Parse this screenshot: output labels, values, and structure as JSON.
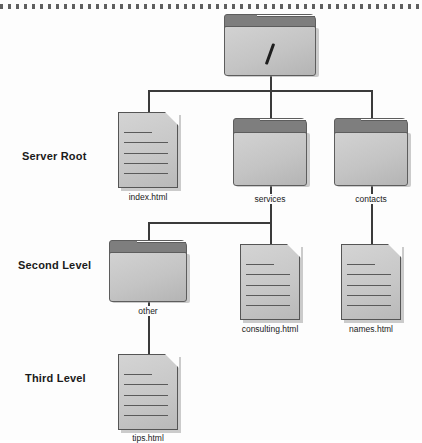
{
  "page": {
    "background_color": "#fdfdfd",
    "line_color": "#3b3b3b",
    "folder_front_color": "#c4c4c4",
    "folder_tab_color": "#7e7e7e",
    "doc_color": "#c6c6c6"
  },
  "row_labels": [
    {
      "text": "Server Root",
      "name": "row-label-server-root"
    },
    {
      "text": "Second Level",
      "name": "row-label-second-level"
    },
    {
      "text": "Third Level",
      "name": "row-label-third-level"
    }
  ],
  "nodes": {
    "root": {
      "label": "/",
      "type": "folder",
      "level": "root"
    },
    "index_html": {
      "label": "index.html",
      "type": "document",
      "level": "Server Root"
    },
    "services": {
      "label": "services",
      "type": "folder",
      "level": "Server Root"
    },
    "contacts": {
      "label": "contacts",
      "type": "folder",
      "level": "Server Root"
    },
    "other": {
      "label": "other",
      "type": "folder",
      "level": "Second Level"
    },
    "consulting_html": {
      "label": "consulting.html",
      "type": "document",
      "level": "Second Level"
    },
    "names_html": {
      "label": "names.html",
      "type": "document",
      "level": "Second Level"
    },
    "tips_html": {
      "label": "tips.html",
      "type": "document",
      "level": "Third Level"
    }
  },
  "tree": {
    "root": "/",
    "children": [
      {
        "label": "index.html",
        "type": "document"
      },
      {
        "label": "services",
        "type": "folder",
        "children": [
          {
            "label": "other",
            "type": "folder",
            "children": [
              {
                "label": "tips.html",
                "type": "document"
              }
            ]
          },
          {
            "label": "consulting.html",
            "type": "document"
          }
        ]
      },
      {
        "label": "contacts",
        "type": "folder",
        "children": [
          {
            "label": "names.html",
            "type": "document"
          }
        ]
      }
    ]
  }
}
